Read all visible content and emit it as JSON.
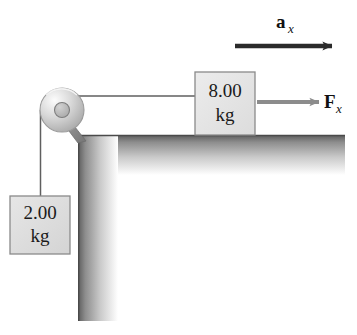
{
  "figure": {
    "background_color": "#ffffff"
  },
  "blocks": [
    {
      "id": "block-8kg",
      "mass_value": "8.00",
      "mass_unit": "kg",
      "position": "on table top, right of pulley",
      "fill_color": "#e2e2e2",
      "border_color": "#8a8a8a",
      "x": 195,
      "y": 72,
      "width": 60,
      "height": 63
    },
    {
      "id": "block-2kg",
      "mass_value": "2.00",
      "mass_unit": "kg",
      "position": "hanging from rope at left",
      "fill_color": "#dcdcdc",
      "border_color": "#8a8a8a",
      "x": 10,
      "y": 196,
      "width": 60,
      "height": 58
    }
  ],
  "vectors": [
    {
      "id": "acceleration-vector",
      "symbol": "a",
      "subscript": "x",
      "direction": "right",
      "color": "#2b2b2b",
      "label_x": 281,
      "label_y": 26,
      "arrow_x1": 235,
      "arrow_x2": 333,
      "arrow_y": 46
    },
    {
      "id": "force-vector",
      "symbol": "F",
      "subscript": "x",
      "direction": "right",
      "color": "#8c8c8c",
      "label_x": 326,
      "label_y": 107,
      "arrow_x1": 258,
      "arrow_x2": 320,
      "arrow_y": 102
    }
  ],
  "pulley": {
    "id": "pulley",
    "center_x": 62,
    "center_y": 110,
    "radius": 22,
    "hub_radius": 7,
    "rim_color": "#9a9a9a",
    "face_light": "#fbfbfb",
    "face_dark": "#9d9d9d",
    "hub_color": "#b5b5b5"
  },
  "ropes": [
    {
      "id": "rope-horizontal",
      "from": "pulley-top",
      "to": "block-8kg-left",
      "x1": 62,
      "y1": 96,
      "x2": 195,
      "y2": 96,
      "color": "#5f5f5f"
    },
    {
      "id": "rope-vertical",
      "from": "pulley-left",
      "to": "block-2kg-top",
      "x1": 41,
      "y1": 112,
      "x2": 41,
      "y2": 196,
      "color": "#5f5f5f"
    }
  ],
  "table": {
    "id": "table-surface",
    "shape": "L-shaped corner",
    "top_x": 78,
    "top_y": 135,
    "top_width": 267,
    "top_height": 40,
    "leg_x": 78,
    "leg_y": 135,
    "leg_width": 40,
    "leg_height": 186,
    "edge_color": "#5c5c5c",
    "fade_color": "#ffffff"
  }
}
